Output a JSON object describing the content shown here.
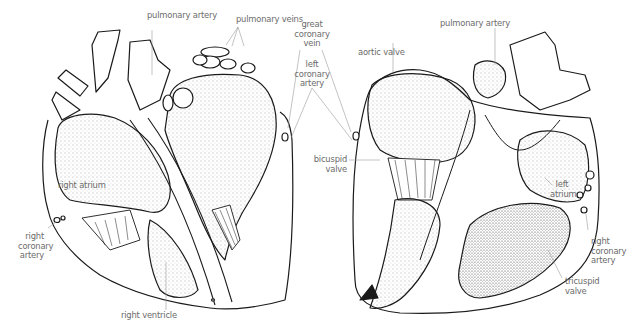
{
  "diagram": {
    "colors": {
      "outline": "#1a1a1a",
      "stipple": "#555555",
      "leader": "#9a9a9a",
      "label": "#6b6b6b",
      "background": "#ffffff"
    },
    "left_view": {
      "labels": {
        "pulmonary_artery": "pulmonary artery",
        "pulmonary_veins": "pulmonary veins",
        "right_atrium": "right atrium",
        "right_coronary_artery": [
          "right",
          "coronary",
          "artery"
        ],
        "right_ventricle": "right ventricle"
      }
    },
    "center": {
      "labels": {
        "great_coronary_vein": [
          "great",
          "coronary",
          "vein"
        ],
        "left_coronary_artery": [
          "left",
          "coronary",
          "artery"
        ],
        "bicuspid_valve": [
          "bicuspid",
          "valve"
        ]
      }
    },
    "right_view": {
      "labels": {
        "pulmonary_artery": "pulmonary artery",
        "aortic_valve": "aortic valve",
        "left_atrium": [
          "left",
          "atrium"
        ],
        "right_coronary_artery": [
          "right",
          "coronary",
          "artery"
        ],
        "tricuspid_valve": [
          "tricuspid",
          "valve"
        ]
      }
    }
  }
}
